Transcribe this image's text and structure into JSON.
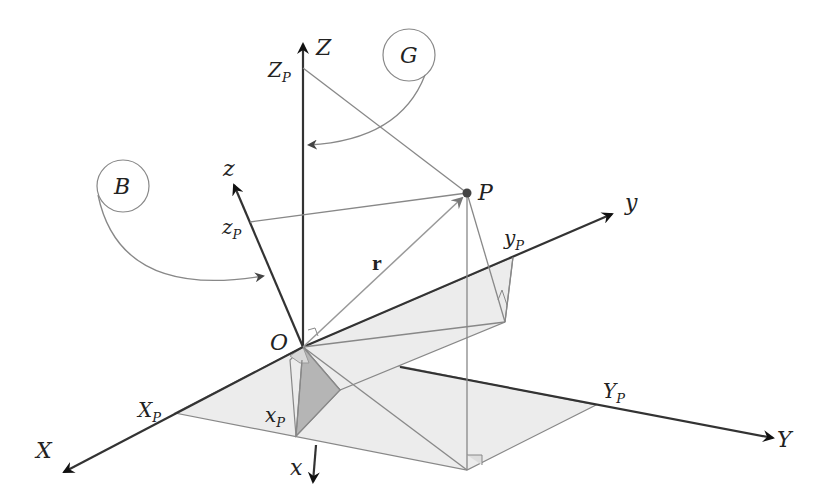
{
  "figure": {
    "frames": [
      {
        "name": "G",
        "label": "G",
        "axes": [
          "X",
          "Y",
          "Z"
        ]
      },
      {
        "name": "B",
        "label": "B",
        "axes": [
          "x",
          "y",
          "z"
        ]
      }
    ],
    "labels": {
      "Z": "Z",
      "Z_P": "Z",
      "Z_P_sub": "P",
      "G": "G",
      "B": "B",
      "z": "z",
      "z_P": "z",
      "z_P_sub": "P",
      "P": "P",
      "y": "y",
      "y_P": "y",
      "y_P_sub": "P",
      "r": "r",
      "O": "O",
      "X_P": "X",
      "X_P_sub": "P",
      "x_P": "x",
      "x_P_sub": "P",
      "Y_P": "Y",
      "Y_P_sub": "P",
      "X": "X",
      "x": "x",
      "Y": "Y"
    },
    "colors": {
      "axis": "#333333",
      "projection_line": "#888888",
      "plane_fill": "#ececec",
      "shaded_fill": "#b5b5b5",
      "point": "#444444"
    }
  }
}
